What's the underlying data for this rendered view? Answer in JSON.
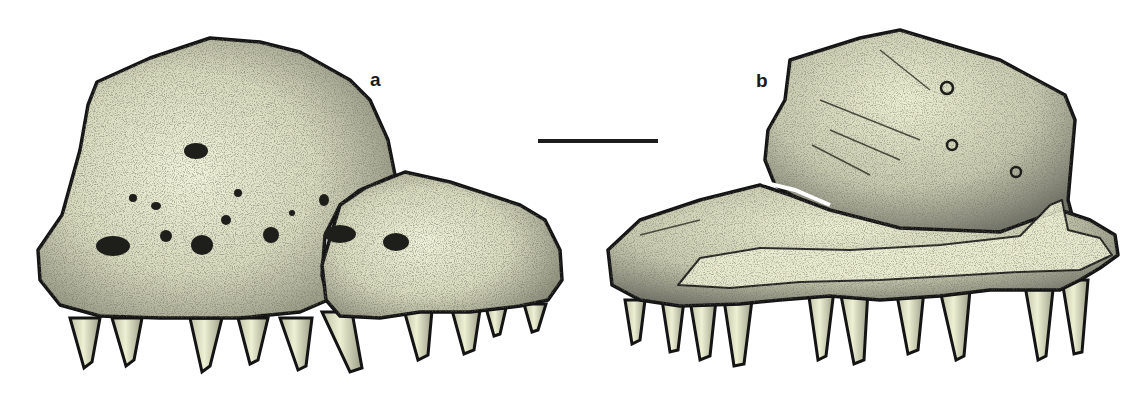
{
  "figure": {
    "panels": [
      {
        "id": "a",
        "label": "a"
      },
      {
        "id": "b",
        "label": "b"
      }
    ],
    "scale_bar": {
      "label": ""
    },
    "colors": {
      "bone_fill": "#eef0d4",
      "stipple_dark": "#2a2a22",
      "outline": "#141414",
      "background": "#ffffff"
    }
  }
}
